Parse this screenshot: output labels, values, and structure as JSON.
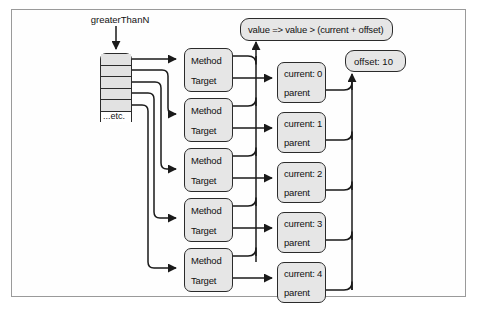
{
  "figure": {
    "kind": "closure-capture-object-diagram",
    "variable_label": "greaterThanN",
    "array_etc_label": "...etc.",
    "lambda_label": "value => value > (current + offset)",
    "outer_scope_label": "offset: 10",
    "array_cell_count": 5
  },
  "delegates": [
    {
      "method_label": "Method",
      "target_label": "Target"
    },
    {
      "method_label": "Method",
      "target_label": "Target"
    },
    {
      "method_label": "Method",
      "target_label": "Target"
    },
    {
      "method_label": "Method",
      "target_label": "Target"
    },
    {
      "method_label": "Method",
      "target_label": "Target"
    }
  ],
  "closures": [
    {
      "current_label": "current: 0",
      "parent_label": "parent"
    },
    {
      "current_label": "current: 1",
      "parent_label": "parent"
    },
    {
      "current_label": "current: 2",
      "parent_label": "parent"
    },
    {
      "current_label": "current: 3",
      "parent_label": "parent"
    },
    {
      "current_label": "current: 4",
      "parent_label": "parent"
    }
  ],
  "colors": {
    "node_fill": "#e6e6e6",
    "node_stroke": "#2b2b2b",
    "frame_stroke": "#9a9a9a",
    "page_background": "#ffffff",
    "text": "#111111"
  }
}
